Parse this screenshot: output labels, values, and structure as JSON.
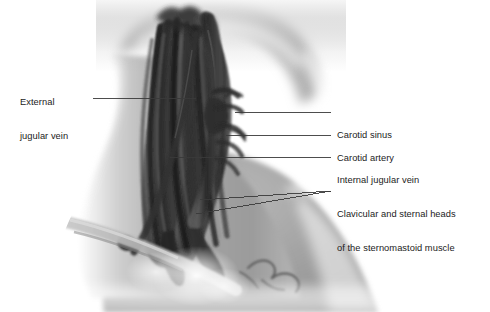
{
  "figure": {
    "background_color": "#ffffff",
    "label_text_color": "#1b1b1b",
    "leader_line_color": "#3a3a3a",
    "skin_tone_color": "#a9a9a9",
    "muscle_color": "#3c3c3c"
  },
  "labels": [
    {
      "id": "external-jugular-vein",
      "text_lines": [
        "External",
        "jugular vein"
      ],
      "side": "left",
      "text_x": 20,
      "text_y": 74,
      "leader": {
        "x1": 93,
        "y1": 98,
        "x2": 196,
        "y2": 98
      }
    },
    {
      "id": "carotid-sinus",
      "text_lines": [
        "Carotid sinus"
      ],
      "side": "right",
      "text_x": 337,
      "text_y": 107,
      "leader": {
        "x1": 331,
        "y1": 112,
        "x2": 235,
        "y2": 112
      }
    },
    {
      "id": "carotid-artery",
      "text_lines": [
        "Carotid artery"
      ],
      "side": "right",
      "text_x": 337,
      "text_y": 130,
      "leader": {
        "x1": 331,
        "y1": 135,
        "x2": 226,
        "y2": 135
      }
    },
    {
      "id": "internal-jugular-vein",
      "text_lines": [
        "Internal jugular vein"
      ],
      "side": "right",
      "text_x": 337,
      "text_y": 152,
      "leader": {
        "x1": 331,
        "y1": 157,
        "x2": 170,
        "y2": 157
      }
    },
    {
      "id": "clavicular-and-sternal-heads",
      "text_lines": [
        "Clavicular and sternal heads",
        "of the sternomastoid muscle"
      ],
      "side": "right",
      "text_x": 337,
      "text_y": 186,
      "leader": {
        "x1": 331,
        "y1": 191,
        "x2": 200,
        "y2": 200
      },
      "leader2": {
        "x1": 331,
        "y1": 191,
        "x2": 196,
        "y2": 214
      }
    }
  ],
  "anatomy_parts": [
    {
      "id": "head-and-jaw",
      "name": "Head and mandible"
    },
    {
      "id": "neck-skin",
      "name": "Neck surface"
    },
    {
      "id": "shoulder-and-trapezius",
      "name": "Shoulder and trapezius"
    },
    {
      "id": "sternomastoid-muscle",
      "name": "Sternomastoid muscle belly"
    },
    {
      "id": "internal-jugular-vein-vessel",
      "name": "Internal jugular vein"
    },
    {
      "id": "carotid-artery-vessel",
      "name": "Carotid artery"
    },
    {
      "id": "carotid-sinus-bulge",
      "name": "Carotid sinus"
    },
    {
      "id": "external-jugular-vein-vessel",
      "name": "External jugular vein"
    },
    {
      "id": "clavicle-bone",
      "name": "Clavicle"
    },
    {
      "id": "sternal-notch",
      "name": "Sternal notch / manubrium"
    }
  ]
}
